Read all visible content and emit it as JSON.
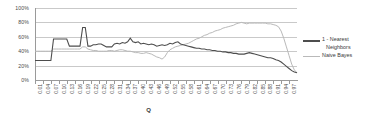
{
  "chart_data": {
    "type": "line",
    "title": "",
    "xlabel": "Q",
    "ylabel": "",
    "ylim": [
      0,
      1.0
    ],
    "ytick_labels": [
      "0%",
      "20%",
      "40%",
      "60%",
      "80%",
      "100%"
    ],
    "ytick_values": [
      0,
      0.2,
      0.4,
      0.6,
      0.8,
      1.0
    ],
    "grid": true,
    "legend_position": "right",
    "x": [
      0.01,
      0.02,
      0.03,
      0.04,
      0.05,
      0.06,
      0.07,
      0.08,
      0.09,
      0.1,
      0.11,
      0.12,
      0.13,
      0.14,
      0.15,
      0.16,
      0.17,
      0.18,
      0.19,
      0.2,
      0.21,
      0.22,
      0.23,
      0.24,
      0.25,
      0.26,
      0.27,
      0.28,
      0.29,
      0.3,
      0.31,
      0.32,
      0.33,
      0.34,
      0.35,
      0.36,
      0.37,
      0.38,
      0.39,
      0.4,
      0.41,
      0.42,
      0.43,
      0.44,
      0.45,
      0.46,
      0.47,
      0.48,
      0.49,
      0.5,
      0.51,
      0.52,
      0.53,
      0.54,
      0.55,
      0.56,
      0.57,
      0.58,
      0.59,
      0.6,
      0.61,
      0.62,
      0.63,
      0.64,
      0.65,
      0.66,
      0.67,
      0.68,
      0.69,
      0.7,
      0.71,
      0.72,
      0.73,
      0.74,
      0.75,
      0.76,
      0.77,
      0.78,
      0.79,
      0.8,
      0.81,
      0.82,
      0.83,
      0.84,
      0.85,
      0.86,
      0.87,
      0.88,
      0.89,
      0.9,
      0.91,
      0.92,
      0.93,
      0.94,
      0.95,
      0.96,
      0.97,
      0.98,
      0.99,
      1.0
    ],
    "xtick_labels": [
      "0.01",
      "0.04",
      "0.07",
      "0.10",
      "0.13",
      "0.16",
      "0.19",
      "0.22",
      "0.25",
      "0.28",
      "0.31",
      "0.34",
      "0.37",
      "0.40",
      "0.43",
      "0.46",
      "0.49",
      "0.52",
      "0.55",
      "0.58",
      "0.61",
      "0.64",
      "0.67",
      "0.70",
      "0.73",
      "0.76",
      "0.79",
      "0.82",
      "0.85",
      "0.88",
      "0.91",
      "0.94",
      "0.97"
    ],
    "xtick_step": 3,
    "series": [
      {
        "name": "1 - Nearest Neighbors",
        "color": "#4d4d4d",
        "values": [
          0.27,
          0.27,
          0.27,
          0.27,
          0.27,
          0.27,
          0.27,
          0.57,
          0.57,
          0.57,
          0.57,
          0.57,
          0.57,
          0.47,
          0.47,
          0.47,
          0.47,
          0.47,
          0.73,
          0.73,
          0.47,
          0.47,
          0.49,
          0.49,
          0.5,
          0.5,
          0.48,
          0.46,
          0.46,
          0.46,
          0.5,
          0.51,
          0.5,
          0.52,
          0.51,
          0.53,
          0.58,
          0.53,
          0.52,
          0.53,
          0.5,
          0.51,
          0.5,
          0.49,
          0.5,
          0.49,
          0.47,
          0.48,
          0.49,
          0.48,
          0.49,
          0.51,
          0.5,
          0.52,
          0.53,
          0.5,
          0.49,
          0.48,
          0.47,
          0.46,
          0.45,
          0.44,
          0.44,
          0.43,
          0.43,
          0.42,
          0.42,
          0.41,
          0.41,
          0.4,
          0.4,
          0.39,
          0.39,
          0.38,
          0.38,
          0.37,
          0.37,
          0.36,
          0.36,
          0.36,
          0.37,
          0.38,
          0.37,
          0.36,
          0.35,
          0.34,
          0.33,
          0.32,
          0.31,
          0.31,
          0.3,
          0.28,
          0.27,
          0.25,
          0.22,
          0.19,
          0.16,
          0.13,
          0.11,
          0.1
        ]
      },
      {
        "name": "Naive Bayes",
        "color": "#b9b9b9",
        "values": [
          0.4,
          0.4,
          0.4,
          0.4,
          0.4,
          0.4,
          0.4,
          0.43,
          0.43,
          0.43,
          0.43,
          0.43,
          0.43,
          0.43,
          0.43,
          0.43,
          0.43,
          0.43,
          0.46,
          0.46,
          0.43,
          0.42,
          0.41,
          0.41,
          0.4,
          0.4,
          0.4,
          0.4,
          0.41,
          0.41,
          0.4,
          0.41,
          0.42,
          0.42,
          0.41,
          0.4,
          0.4,
          0.39,
          0.38,
          0.38,
          0.37,
          0.37,
          0.38,
          0.37,
          0.36,
          0.34,
          0.32,
          0.31,
          0.29,
          0.32,
          0.38,
          0.42,
          0.44,
          0.46,
          0.47,
          0.48,
          0.49,
          0.5,
          0.51,
          0.53,
          0.55,
          0.57,
          0.58,
          0.6,
          0.62,
          0.63,
          0.65,
          0.66,
          0.68,
          0.69,
          0.7,
          0.72,
          0.73,
          0.74,
          0.75,
          0.76,
          0.78,
          0.79,
          0.8,
          0.79,
          0.78,
          0.79,
          0.79,
          0.79,
          0.79,
          0.79,
          0.79,
          0.79,
          0.78,
          0.78,
          0.77,
          0.76,
          0.74,
          0.68,
          0.58,
          0.46,
          0.34,
          0.22,
          0.14,
          0.1
        ]
      }
    ]
  },
  "legend": {
    "entries": [
      {
        "label_line1": "1 - Nearest",
        "label_line2": "Neighbors"
      },
      {
        "label_line1": "Naive Bayes",
        "label_line2": ""
      }
    ]
  }
}
